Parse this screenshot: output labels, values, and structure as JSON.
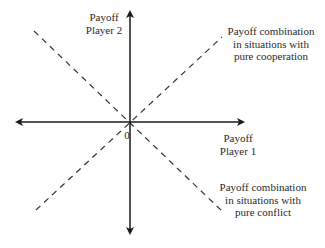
{
  "diagram": {
    "title": "",
    "colors": {
      "axis": "#1a1a1a",
      "dashed": "#333333",
      "text": "#2a2a2a",
      "background": "#ffffff"
    },
    "axes": {
      "y_label": {
        "line1": "Payoff",
        "line2": "Player 2"
      },
      "x_label": {
        "line1": "Payoff",
        "line2": "Player 1"
      },
      "origin_label": "0"
    },
    "lines": [
      {
        "id": "cooperation",
        "style": "dashed",
        "direction": "positive slope",
        "label": {
          "line1": "Payoff combination",
          "line2": "in situations with",
          "line3": "pure cooperation"
        }
      },
      {
        "id": "conflict",
        "style": "dashed",
        "direction": "negative slope",
        "label": {
          "line1": "Payoff combination",
          "line2": "in situations with",
          "line3": "pure conflict"
        }
      }
    ]
  }
}
